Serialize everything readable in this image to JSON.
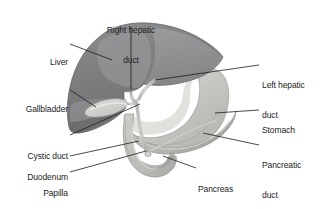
{
  "figure": {
    "kind": "anatomical-illustration",
    "background_color": "#ffffff"
  },
  "palette": {
    "liver_dark": "#77777a",
    "liver_mid": "#8a8a8d",
    "liver_light": "#9d9da0",
    "liver_highlight": "#b4b4b6",
    "gallbladder": "#c9c9c6",
    "gallbladder_light": "#dcdcd8",
    "stomach_body": "#c4c4c0",
    "stomach_light": "#d6d6d2",
    "stomach_shadow": "#aaaaa7",
    "duodenum": "#bdbdb9",
    "duodenum_light": "#cfcfcb",
    "duodenum_shadow": "#a3a3a0",
    "pancreas": "#b6b6b2",
    "pancreas_light": "#cacac6",
    "duct": "#c8c8c4",
    "duct_outline": "#9a9a97",
    "leader_line": "#1d1d1d",
    "text": "#1d1d1d"
  },
  "labels": [
    {
      "id": "right-hepatic-duct",
      "lines": [
        "Right hepatic",
        "duct"
      ],
      "text": "Right hepatic duct",
      "align": "center",
      "x": 98,
      "y": 5,
      "width": 66
    },
    {
      "id": "liver",
      "lines": [
        "Liver"
      ],
      "text": "Liver",
      "align": "right",
      "x": 26,
      "y": 37,
      "width": 42
    },
    {
      "id": "gallbladder",
      "lines": [
        "Gallbladder"
      ],
      "text": "Gallbladder",
      "align": "right",
      "x": 4,
      "y": 84,
      "width": 64
    },
    {
      "id": "cystic-duct",
      "lines": [
        "Cystic duct"
      ],
      "text": "Cystic duct",
      "align": "right",
      "x": 4,
      "y": 131,
      "width": 64
    },
    {
      "id": "duodenum",
      "lines": [
        "Duodenum"
      ],
      "text": "Duodenum",
      "align": "right",
      "x": 4,
      "y": 152,
      "width": 64
    },
    {
      "id": "papilla-of-vater",
      "lines": [
        "Papilla",
        "of Vater"
      ],
      "text": "Papilla of Vater",
      "align": "right",
      "x": 4,
      "y": 168,
      "width": 64
    },
    {
      "id": "left-hepatic-duct",
      "lines": [
        "Left hepatic",
        "duct"
      ],
      "text": "Left hepatic duct",
      "align": "left",
      "x": 262,
      "y": 60,
      "width": 62
    },
    {
      "id": "stomach",
      "lines": [
        "Stomach"
      ],
      "text": "Stomach",
      "align": "left",
      "x": 262,
      "y": 105,
      "width": 62
    },
    {
      "id": "pancreatic-duct",
      "lines": [
        "Pancreatic",
        "duct"
      ],
      "text": "Pancreatic duct",
      "align": "left",
      "x": 262,
      "y": 140,
      "width": 62
    },
    {
      "id": "pancreas",
      "lines": [
        "Pancreas"
      ],
      "text": "Pancreas",
      "align": "left",
      "x": 198,
      "y": 164,
      "width": 56
    }
  ],
  "leader_lines": [
    {
      "id": "leader-right-hepatic-duct",
      "from": [
        131,
        27
      ],
      "to": [
        131,
        92
      ]
    },
    {
      "id": "leader-liver",
      "from": [
        70,
        44
      ],
      "to": [
        112,
        60
      ]
    },
    {
      "id": "leader-gallbladder",
      "from": [
        70,
        90
      ],
      "to": [
        96,
        107
      ]
    },
    {
      "id": "leader-cystic-duct",
      "from": [
        70,
        135
      ],
      "to": [
        140,
        104
      ]
    },
    {
      "id": "leader-duodenum",
      "from": [
        70,
        156
      ],
      "to": [
        139,
        141
      ]
    },
    {
      "id": "leader-papilla-of-vater",
      "from": [
        70,
        172
      ],
      "to": [
        146,
        151
      ]
    },
    {
      "id": "leader-left-hepatic-duct",
      "from": [
        259,
        65
      ],
      "to": [
        155,
        80
      ]
    },
    {
      "id": "leader-stomach",
      "from": [
        259,
        110
      ],
      "to": [
        215,
        113
      ]
    },
    {
      "id": "leader-pancreatic-duct",
      "from": [
        259,
        145
      ],
      "to": [
        203,
        133
      ]
    },
    {
      "id": "leader-pancreas",
      "from": [
        196,
        168
      ],
      "to": [
        163,
        156
      ]
    }
  ]
}
